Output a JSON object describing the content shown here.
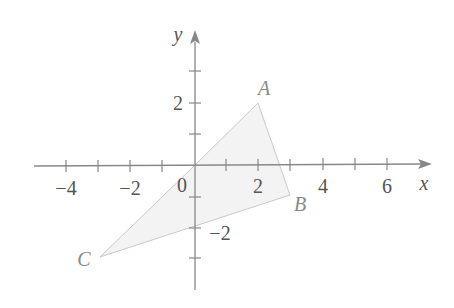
{
  "figure": {
    "type": "coordinate-plane",
    "axes": {
      "x_label": "x",
      "y_label": "y",
      "x_range": [
        -5,
        7
      ],
      "y_range": [
        -4,
        4
      ],
      "x_tick_labels": [
        {
          "value": -4,
          "text": "−4"
        },
        {
          "value": -2,
          "text": "−2"
        },
        {
          "value": 2,
          "text": "2"
        },
        {
          "value": 4,
          "text": "4"
        },
        {
          "value": 6,
          "text": "6"
        }
      ],
      "y_tick_labels": [
        {
          "value": 2,
          "text": "2"
        },
        {
          "value": -2,
          "text": "−2"
        }
      ],
      "origin_label": "0"
    },
    "shape": {
      "kind": "quadrilateral",
      "vertices_order": [
        "O",
        "A",
        "B",
        "C"
      ],
      "fill_color": "#f2f2f2",
      "stroke_color": "#c8c8c8"
    },
    "points": [
      {
        "name": "O",
        "label": "",
        "x": 0,
        "y": 0
      },
      {
        "name": "A",
        "label": "A",
        "x": 2,
        "y": 2
      },
      {
        "name": "B",
        "label": "B",
        "x": 3,
        "y": -1
      },
      {
        "name": "C",
        "label": "C",
        "x": -3,
        "y": -3
      }
    ],
    "colors": {
      "axis": "#888888",
      "text": "#555555",
      "point_label": "#8a8a8a"
    }
  }
}
